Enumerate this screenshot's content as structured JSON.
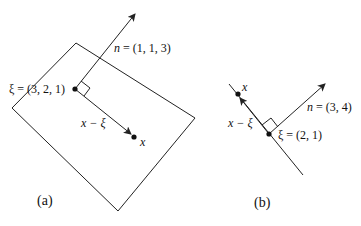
{
  "figure_a": {
    "caption": "(a)",
    "normal_label_var": "n",
    "normal_label_value": " = (1, 1, 3)",
    "xi_label": "ξ = (3, 2, 1)",
    "diff_label": "x − ξ",
    "x_label": "x"
  },
  "figure_b": {
    "caption": "(b)",
    "normal_label_var": "n",
    "normal_label_value": " = (3, 4)",
    "xi_label": "ξ = (2, 1)",
    "diff_label": "x − ξ",
    "x_label": "x"
  },
  "colors": {
    "stroke": "#222222",
    "background": "#ffffff"
  }
}
